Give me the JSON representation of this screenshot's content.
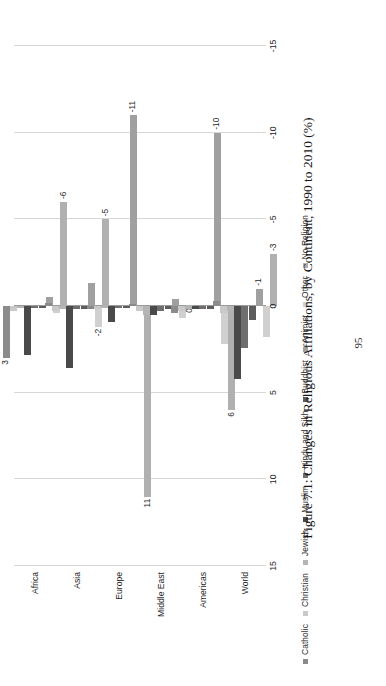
{
  "page": {
    "number": "95",
    "caption": "Figure 7.1: Changes in Religious Affiliations, by Continent, 1990 to 2010 (%)"
  },
  "legend": {
    "items": [
      {
        "label": "Catholic",
        "color": "#8b8b8b"
      },
      {
        "label": "Christian",
        "color": "#c9c9c9"
      },
      {
        "label": "Jewish",
        "color": "#b5b5b5"
      },
      {
        "label": "Muslim",
        "color": "#4a4a4a"
      },
      {
        "label": "Hindu and Sikh",
        "color": "#6e6e6e"
      },
      {
        "label": "Buddhist",
        "color": "#5c5c5c"
      },
      {
        "label": "Animist",
        "color": "#a0a0a0"
      },
      {
        "label": "Other",
        "color": "#d0d0d0"
      },
      {
        "label": "No Religion",
        "color": "#b0b0b0"
      }
    ]
  },
  "chart_data": {
    "type": "bar",
    "title": "Figure 7.1: Changes in Religious Affiliations, by Continent, 1990 to 2010 (%)",
    "orientation": "horizontal",
    "xlabel": "",
    "ylabel": "",
    "xlim": [
      -15,
      15
    ],
    "xticks": [
      "15",
      "10",
      "5",
      "0",
      "-5",
      "-10",
      "-15"
    ],
    "xtick_values": [
      15,
      10,
      5,
      0,
      -5,
      -10,
      -15
    ],
    "grid": true,
    "legend_position": "bottom",
    "categories": [
      "Africa",
      "Asia",
      "Europe",
      "Middle East",
      "Americas",
      "World"
    ],
    "series": [
      {
        "name": "Catholic",
        "color": "#8b8b8b",
        "values": [
          3.0,
          -0.2,
          0.2,
          -0.1,
          0.4,
          -0.3
        ]
      },
      {
        "name": "Christian",
        "color": "#c9c9c9",
        "values": [
          0.3,
          0.3,
          0.2,
          0.3,
          0.3,
          0.4
        ]
      },
      {
        "name": "Jewish",
        "color": "#b5b5b5",
        "values": [
          0.1,
          0.2,
          0.1,
          0.5,
          0.2,
          0.3
        ]
      },
      {
        "name": "Muslim",
        "color": "#4a4a4a",
        "values": [
          2.8,
          3.6,
          0.9,
          0.5,
          0.2,
          4.2
        ]
      },
      {
        "name": "Hindu and Sikh",
        "color": "#6e6e6e",
        "values": [
          0.1,
          0.2,
          0.1,
          0.3,
          0.2,
          2.4
        ]
      },
      {
        "name": "Buddhist",
        "color": "#5c5c5c",
        "values": [
          0.1,
          0.2,
          0.1,
          0.2,
          0.2,
          0.8
        ]
      },
      {
        "name": "Animist",
        "color": "#a0a0a0",
        "values": [
          -0.5,
          -1.3,
          -11.0,
          -0.4,
          -10.0,
          -1.0
        ]
      },
      {
        "name": "Other",
        "color": "#d0d0d0",
        "values": [
          0.4,
          1.2,
          0.3,
          0.7,
          2.2,
          1.8
        ]
      },
      {
        "name": "No Religion",
        "color": "#b0b0b0",
        "values": [
          -6.0,
          -5.0,
          11.0,
          0.0,
          6.0,
          -3.0
        ]
      }
    ],
    "data_labels": [
      {
        "category": "Africa",
        "series": "Catholic",
        "text": "3"
      },
      {
        "category": "Africa",
        "series": "No Religion",
        "text": "-6"
      },
      {
        "category": "Asia",
        "series": "No Religion",
        "text": "-5"
      },
      {
        "category": "Asia",
        "series": "Other",
        "text": "-2"
      },
      {
        "category": "Europe",
        "series": "No Religion",
        "text": "11"
      },
      {
        "category": "Europe",
        "series": "Animist",
        "text": "-11"
      },
      {
        "category": "Middle East",
        "series": "No Religion",
        "text": "0"
      },
      {
        "category": "Americas",
        "series": "Animist",
        "text": "-10"
      },
      {
        "category": "Americas",
        "series": "No Religion",
        "text": "6"
      },
      {
        "category": "World",
        "series": "Animist",
        "text": "-1"
      },
      {
        "category": "World",
        "series": "No Religion",
        "text": "-3"
      }
    ]
  }
}
